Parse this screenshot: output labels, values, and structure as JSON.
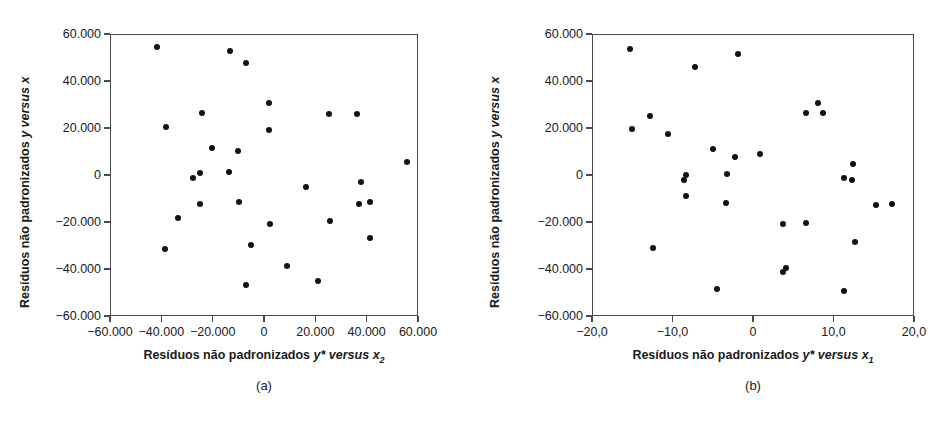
{
  "figure": {
    "background": "#ffffff",
    "dot_color": "#111111",
    "axis_color": "#4a4a4a"
  },
  "panels": [
    {
      "id": "a",
      "caption": "(a)",
      "y_axis_title_plain": "Resíduos não padronizados y versus x",
      "y_axis_title_parts": {
        "prefix": "Resíduos não padronizados ",
        "var1": "y",
        "mid": " versus ",
        "var2": "x",
        "sub": ""
      },
      "x_axis_title_parts": {
        "prefix": "Resíduos não padronizados ",
        "var1": "y*",
        "mid": " versus ",
        "var2": "x",
        "sub": "2"
      },
      "x_axis_title_plain": "Resíduos não padronizados y* versus x2",
      "x_ticks": [
        "-60.000",
        "-40.000",
        "-20.000",
        "0",
        "20.000",
        "40.000",
        "60.000"
      ],
      "y_ticks": [
        "60.000",
        "40.000",
        "20.000",
        "0",
        "-20.000",
        "-40.000",
        "-60.000"
      ]
    },
    {
      "id": "b",
      "caption": "(b)",
      "y_axis_title_plain": "Resíduos não padronizados y versus x",
      "y_axis_title_parts": {
        "prefix": "Resíduos não padronizados ",
        "var1": "y",
        "mid": " versus ",
        "var2": "x",
        "sub": ""
      },
      "x_axis_title_parts": {
        "prefix": "Resíduos não padronizados ",
        "var1": "y*",
        "mid": " versus ",
        "var2": "x",
        "sub": "1"
      },
      "x_axis_title_plain": "Resíduos não padronizados y* versus x1",
      "x_ticks": [
        "-20,0",
        "-10,0",
        "0",
        "10,0",
        "20,0"
      ],
      "y_ticks": [
        "60.000",
        "40.000",
        "20.000",
        "0",
        "-20.000",
        "-40.000",
        "-60.000"
      ]
    }
  ],
  "chart_data": [
    {
      "type": "scatter",
      "panel": "a",
      "title": "(a)",
      "xlabel": "Resíduos não padronizados y* versus x2",
      "ylabel": "Resíduos não padronizados y versus x",
      "xlim": [
        -60000,
        60000
      ],
      "ylim": [
        -60000,
        60000
      ],
      "xticks": [
        -60000,
        -40000,
        -20000,
        0,
        20000,
        40000,
        60000
      ],
      "yticks": [
        -60000,
        -40000,
        -20000,
        0,
        20000,
        40000,
        60000
      ],
      "xticklabels": [
        "-60.000",
        "-40.000",
        "-20.000",
        "0",
        "20.000",
        "40.000",
        "60.000"
      ],
      "yticklabels": [
        "-60.000",
        "-40.000",
        "-20.000",
        "0",
        "20.000",
        "40.000",
        "60.000"
      ],
      "grid": false,
      "legend": null,
      "points": [
        [
          -42000,
          55000
        ],
        [
          -13500,
          53000
        ],
        [
          -7500,
          48000
        ],
        [
          1500,
          31000
        ],
        [
          -24500,
          27000
        ],
        [
          25000,
          26500
        ],
        [
          36000,
          26500
        ],
        [
          -38500,
          21000
        ],
        [
          1500,
          19500
        ],
        [
          -20500,
          12000
        ],
        [
          -10500,
          10500
        ],
        [
          -25500,
          1200
        ],
        [
          -14000,
          1500
        ],
        [
          -28000,
          -1000
        ],
        [
          55500,
          6000
        ],
        [
          37500,
          -2500
        ],
        [
          16000,
          -4500
        ],
        [
          -10000,
          -11000
        ],
        [
          -25500,
          -12000
        ],
        [
          36500,
          -12000
        ],
        [
          41000,
          -11000
        ],
        [
          -34000,
          -18000
        ],
        [
          25500,
          -19000
        ],
        [
          2000,
          -20500
        ],
        [
          -5500,
          -29500
        ],
        [
          -39000,
          -31000
        ],
        [
          41000,
          -26500
        ],
        [
          8500,
          -38500
        ],
        [
          -7500,
          -46500
        ],
        [
          20500,
          -44500
        ]
      ]
    },
    {
      "type": "scatter",
      "panel": "b",
      "title": "(b)",
      "xlabel": "Resíduos não padronizados y* versus x1",
      "ylabel": "Resíduos não padronizados y versus x",
      "xlim": [
        -20.0,
        20.0
      ],
      "ylim": [
        -60000,
        60000
      ],
      "xticks": [
        -20.0,
        -10.0,
        0,
        10.0,
        20.0
      ],
      "yticks": [
        -60000,
        -40000,
        -20000,
        0,
        20000,
        40000,
        60000
      ],
      "xticklabels": [
        "-20,0",
        "-10,0",
        "0",
        "10,0",
        "20,0"
      ],
      "yticklabels": [
        "-60.000",
        "-40.000",
        "-20.000",
        "0",
        "20.000",
        "40.000",
        "60.000"
      ],
      "grid": false,
      "legend": null,
      "points": [
        [
          -15.4,
          54000
        ],
        [
          -2.0,
          52000
        ],
        [
          -7.3,
          46500
        ],
        [
          7.9,
          31000
        ],
        [
          -12.9,
          25500
        ],
        [
          6.4,
          27000
        ],
        [
          8.6,
          27000
        ],
        [
          -15.2,
          20000
        ],
        [
          -10.7,
          18000
        ],
        [
          -5.1,
          11500
        ],
        [
          0.7,
          9500
        ],
        [
          -2.4,
          8000
        ],
        [
          12.3,
          5000
        ],
        [
          -3.4,
          1000
        ],
        [
          -8.5,
          300
        ],
        [
          -8.7,
          -1500
        ],
        [
          11.2,
          -1000
        ],
        [
          12.2,
          -1500
        ],
        [
          -8.4,
          -8500
        ],
        [
          -3.5,
          -11500
        ],
        [
          15.1,
          -12500
        ],
        [
          17.2,
          -11800
        ],
        [
          3.6,
          -20500
        ],
        [
          6.4,
          -20000
        ],
        [
          -12.5,
          -30500
        ],
        [
          12.6,
          -28000
        ],
        [
          4.0,
          -39000
        ],
        [
          3.6,
          -41000
        ],
        [
          -4.6,
          -48000
        ],
        [
          11.2,
          -49000
        ]
      ]
    }
  ]
}
